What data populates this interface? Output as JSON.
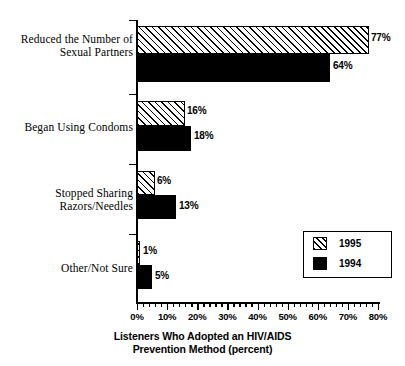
{
  "chart_data": {
    "type": "bar",
    "orientation": "horizontal",
    "title": "",
    "xlabel": "Listeners Who Adopted an HIV/AIDS\nPrevention Method (percent)",
    "ylabel": "",
    "xlim": [
      0,
      80
    ],
    "xtick_labels": [
      "0%",
      "10%",
      "20%",
      "30%",
      "40%",
      "50%",
      "60%",
      "70%",
      "80%"
    ],
    "xtick_values": [
      0,
      10,
      20,
      30,
      40,
      50,
      60,
      70,
      80
    ],
    "minor_tick_step": 2,
    "grid": false,
    "legend_position": "lower-right",
    "categories": [
      "Reduced the Number of\nSexual Partners",
      "Began Using Condoms",
      "Stopped Sharing\nRazors/Needles",
      "Other/Not Sure"
    ],
    "series": [
      {
        "name": "1995",
        "fill": "hatched",
        "values": [
          77,
          16,
          6,
          1
        ],
        "value_labels": [
          "77%",
          "16%",
          "6%",
          "1%"
        ]
      },
      {
        "name": "1994",
        "fill": "solid-black",
        "values": [
          64,
          18,
          13,
          5
        ],
        "value_labels": [
          "64%",
          "18%",
          "13%",
          "5%"
        ]
      }
    ]
  },
  "legend": {
    "entries": [
      {
        "label": "1995",
        "swatch": "hatched"
      },
      {
        "label": "1994",
        "swatch": "solid-black"
      }
    ]
  },
  "colors": {
    "ink": "#000000",
    "background": "#ffffff",
    "bar_1995_fill": "#ffffff",
    "bar_1995_hatch": "#000000",
    "bar_1994_fill": "#000000"
  }
}
